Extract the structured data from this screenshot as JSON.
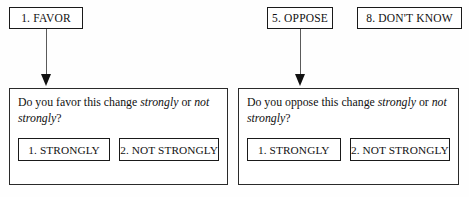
{
  "diagram": {
    "top_options": [
      {
        "id": "favor",
        "label": "1. FAVOR"
      },
      {
        "id": "oppose",
        "label": "5. OPPOSE"
      },
      {
        "id": "dont_know",
        "label": "8. DON'T KNOW"
      }
    ],
    "branches": [
      {
        "id": "favor_branch",
        "arrow": "down-arrow",
        "question": {
          "part1": "Do you favor this change ",
          "em1": "strongly",
          "part2": " or ",
          "em2": "not strongly",
          "part3": "?"
        },
        "answers": [
          {
            "id": "favor_strongly",
            "label": "1. STRONGLY"
          },
          {
            "id": "favor_not_strongly",
            "label": "2. NOT STRONGLY"
          }
        ]
      },
      {
        "id": "oppose_branch",
        "arrow": "down-arrow",
        "question": {
          "part1": "Do you oppose this change ",
          "em1": "strongly",
          "part2": " or ",
          "em2": "not strongly",
          "part3": "?"
        },
        "answers": [
          {
            "id": "oppose_strongly",
            "label": "1. STRONGLY"
          },
          {
            "id": "oppose_not_strongly",
            "label": "2. NOT STRONGLY"
          }
        ]
      }
    ],
    "colors": {
      "ink": "#111111",
      "border": "#1a1a1a",
      "arrow_shaft": "#5a5a5a",
      "background": "#fefefe"
    }
  }
}
